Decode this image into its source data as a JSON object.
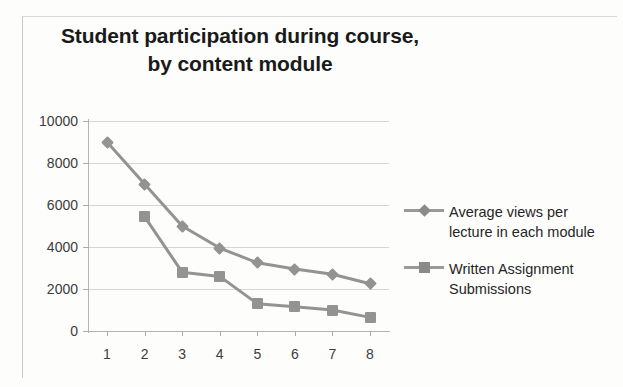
{
  "title": {
    "line1": "Student participation during course,",
    "line2": "by content module"
  },
  "legend": {
    "position": "right",
    "entries": [
      {
        "label_line1": "Average views per",
        "label_line2": "lecture in each module",
        "marker": "diamond-marker"
      },
      {
        "label_line1": "Written Assignment",
        "label_line2": "Submissions",
        "marker": "square-marker"
      }
    ]
  },
  "axes": {
    "y_ticks": [
      "0",
      "2000",
      "4000",
      "6000",
      "8000",
      "10000"
    ],
    "x_ticks": [
      "1",
      "2",
      "3",
      "4",
      "5",
      "6",
      "7",
      "8"
    ]
  },
  "colors": {
    "series": "#939393",
    "gridline": "#d6d6d4",
    "axis": "#b4b4b2",
    "text": "#3c3c3c",
    "title": "#1a1a1a",
    "background": "#fdfdfc"
  },
  "chart_data": {
    "type": "line",
    "title": "Student participation during course, by content module",
    "xlabel": "",
    "ylabel": "",
    "categories": [
      "1",
      "2",
      "3",
      "4",
      "5",
      "6",
      "7",
      "8"
    ],
    "ylim": [
      0,
      10000
    ],
    "xlim": [
      1,
      8
    ],
    "ytick_interval": 2000,
    "grid": true,
    "legend_position": "right",
    "series": [
      {
        "name": "Average views per lecture in each module",
        "marker": "diamond",
        "values": [
          9000,
          7000,
          5000,
          3950,
          3250,
          2950,
          2700,
          2250
        ]
      },
      {
        "name": "Written Assignment Submissions",
        "marker": "square",
        "values": [
          null,
          5450,
          2800,
          2600,
          1300,
          1150,
          1000,
          650
        ]
      }
    ]
  }
}
